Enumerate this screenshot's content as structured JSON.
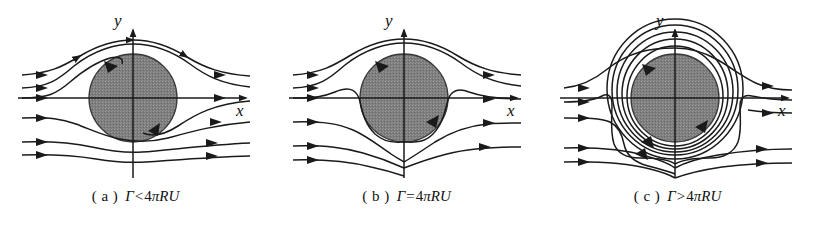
{
  "figure": {
    "background_color": "#ffffff",
    "stroke_color": "#1a1a1a",
    "cylinder_fill": "#808080",
    "cylinder_edge": "#333333"
  },
  "panels": [
    {
      "id": "a",
      "caption_label": "( a )",
      "caption_expr": {
        "gamma": "Γ",
        "operator": "<",
        "coefficient": "4",
        "pi": "π",
        "radius": "R",
        "velocity": "U",
        "full": "Γ<4πRU"
      },
      "axis_x_label": "x",
      "axis_y_label": "y",
      "description": "Circulation less than 4πRU: two stagnation points on the cylinder surface",
      "stagnation_points": 2,
      "stagnation_on_surface": true,
      "closed_streamlines": false,
      "inflow_streamlines": 5,
      "outflow_streamlines": 5,
      "surface_arrows": 2
    },
    {
      "id": "b",
      "caption_label": "( b )",
      "caption_expr": {
        "gamma": "Γ",
        "operator": "=",
        "coefficient": "4",
        "pi": "π",
        "radius": "R",
        "velocity": "U",
        "full": "Γ=4πRU"
      },
      "axis_x_label": "x",
      "axis_y_label": "y",
      "description": "Critical circulation equal to 4πRU: single stagnation point at the bottom of the cylinder",
      "stagnation_points": 1,
      "stagnation_on_surface": true,
      "closed_streamlines": false,
      "inflow_streamlines": 5,
      "outflow_streamlines": 5,
      "surface_arrows": 2
    },
    {
      "id": "c",
      "caption_label": "( c )",
      "caption_expr": {
        "gamma": "Γ",
        "operator": ">",
        "coefficient": "4",
        "pi": "π",
        "radius": "R",
        "velocity": "U",
        "full": "Γ>4πRU"
      },
      "axis_x_label": "x",
      "axis_y_label": "y",
      "description": "Circulation greater than 4πRU: stagnation point moves off the cylinder into the fluid, closed streamlines encircle the cylinder",
      "stagnation_points": 1,
      "stagnation_on_surface": false,
      "closed_streamlines": true,
      "closed_streamline_count": 5,
      "inflow_streamlines": 5,
      "outflow_streamlines": 5,
      "surface_arrows": 4
    }
  ],
  "geometry": {
    "center_x": 133,
    "center_y": 98,
    "radius": 44,
    "axis_x_left": 18,
    "axis_x_right": 252,
    "axis_y_top": 26,
    "axis_y_bottom": 178
  }
}
